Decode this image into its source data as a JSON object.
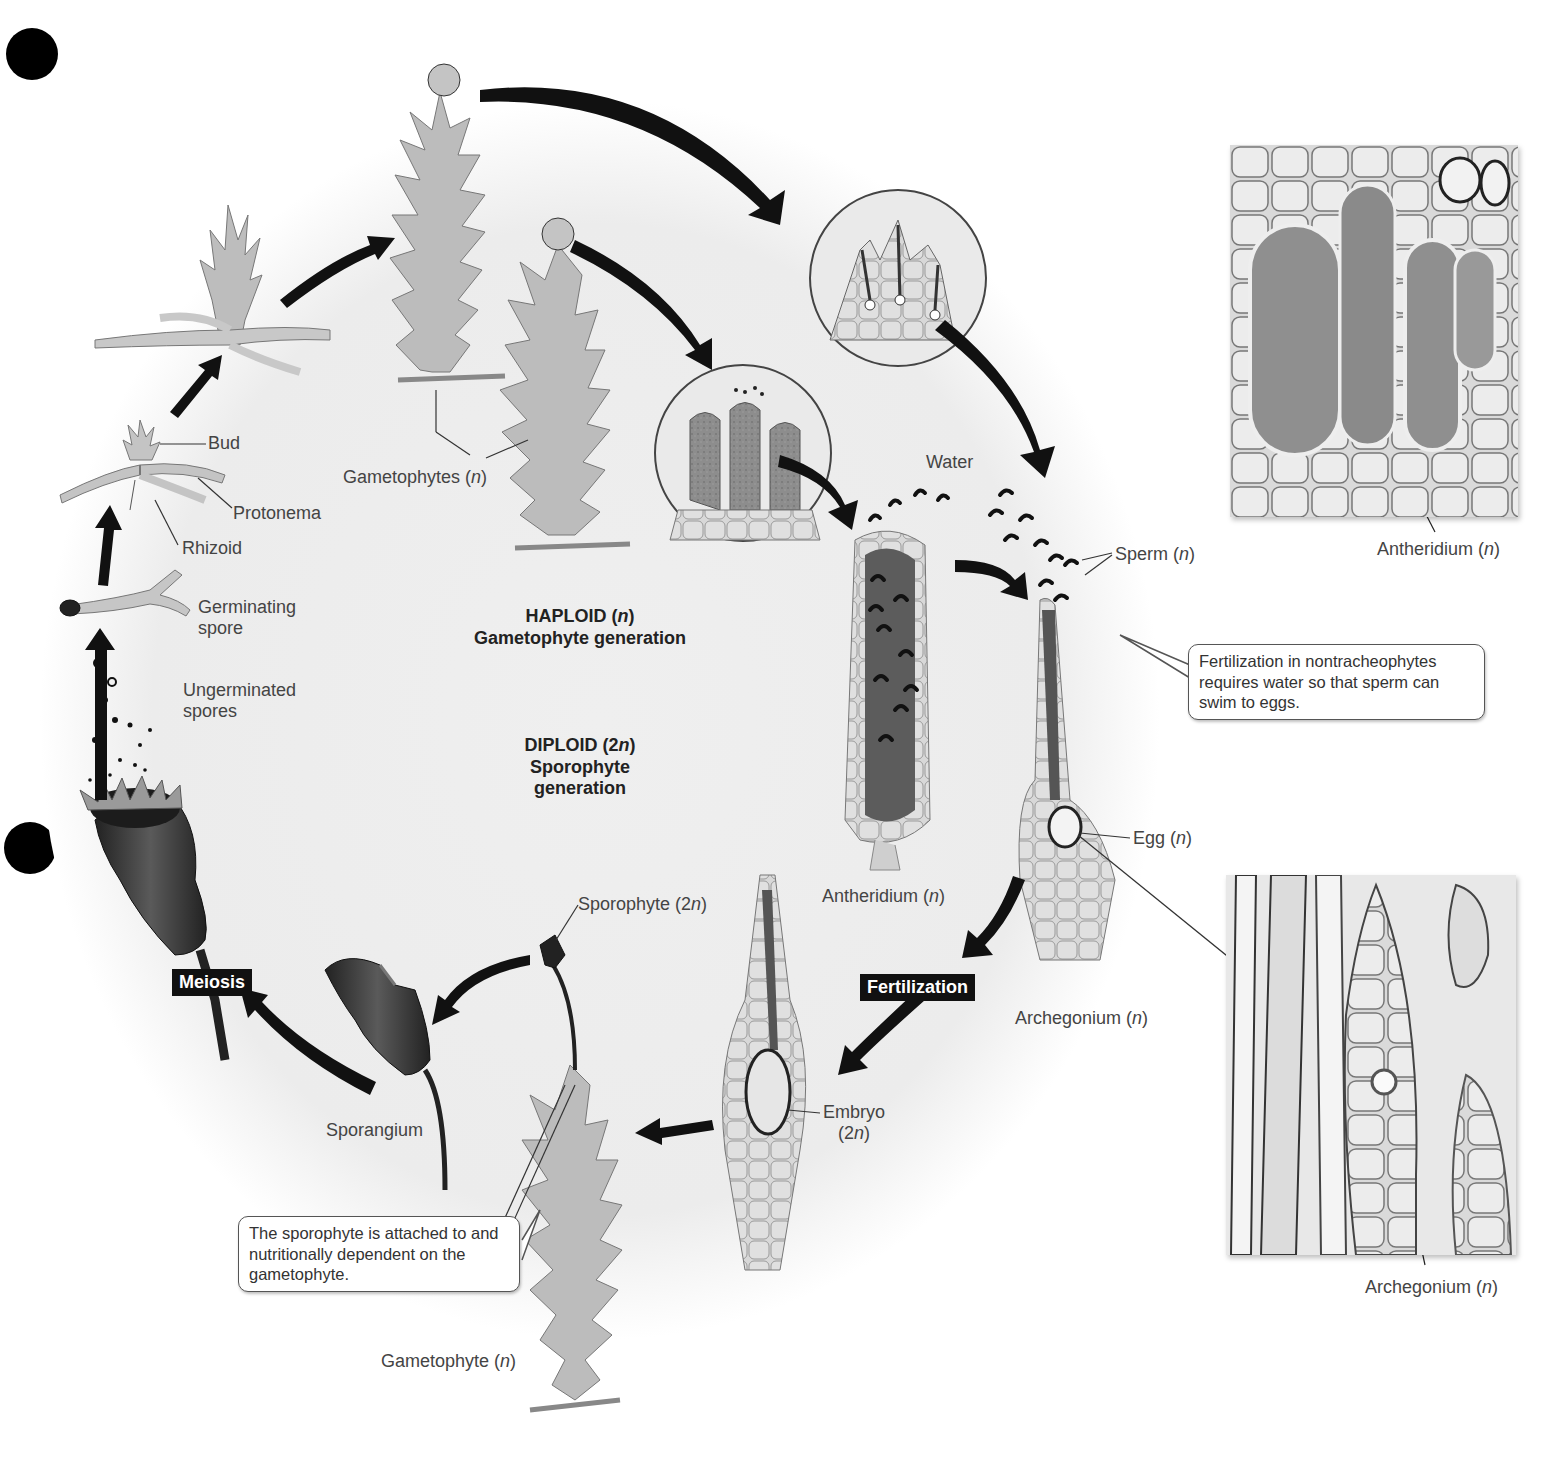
{
  "figure": {
    "center": {
      "haploid_title": "HAPLOID (n)",
      "haploid_sub": "Gametophyte generation",
      "diploid_title": "DIPLOID (2n)",
      "diploid_sub1": "Sporophyte",
      "diploid_sub2": "generation"
    },
    "stage_tags": {
      "meiosis": "Meiosis",
      "fertilization": "Fertilization"
    },
    "labels": {
      "bud": "Bud",
      "protonema": "Protonema",
      "rhizoid": "Rhizoid",
      "germinating_spore_1": "Germinating",
      "germinating_spore_2": "spore",
      "ungerminated_spores_1": "Ungerminated",
      "ungerminated_spores_2": "spores",
      "gametophytes": "Gametophytes (n)",
      "water": "Water",
      "sperm": "Sperm (n)",
      "antheridium": "Antheridium (n)",
      "egg": "Egg (n)",
      "archegonium": "Archegonium (n)",
      "embryo_1": "Embryo",
      "embryo_2": "(2n)",
      "sporophyte": "Sporophyte (2n)",
      "sporangium": "Sporangium",
      "gametophyte": "Gametophyte (n)",
      "micrograph_antheridium": "Antheridium (n)",
      "micrograph_archegonium": "Archegonium (n)"
    },
    "callouts": {
      "fertilization_note": "Fertilization in nontracheophytes requires water so that sperm can swim to eggs.",
      "sporophyte_note": "The sporophyte is attached to and nutritionally dependent on the gametophyte."
    },
    "colors": {
      "cycle_background": "#ececec",
      "arrow": "#111111",
      "plant_fill": "#b9b9b9",
      "plant_stroke": "#777777",
      "capsule": "#3a3a3a",
      "tag_bg": "#111111"
    }
  }
}
